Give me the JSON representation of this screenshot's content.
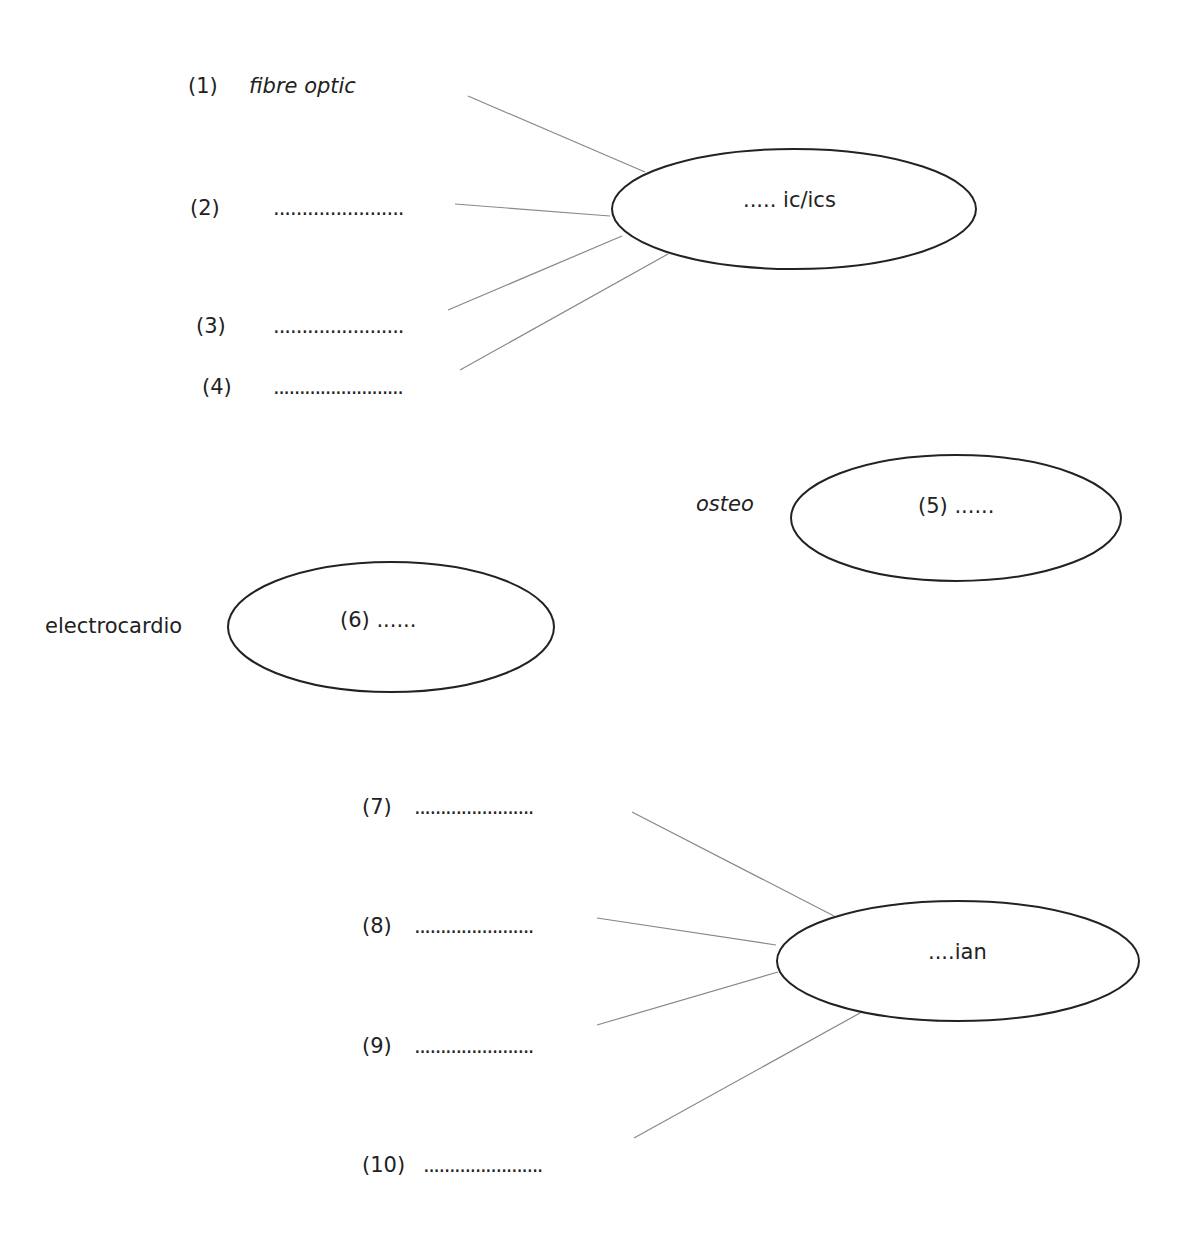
{
  "diagram": {
    "group1": {
      "center": "..... ic/ics",
      "items": [
        {
          "num": "(1)",
          "text": "fibre optic"
        },
        {
          "num": "(2)",
          "text": "......................."
        },
        {
          "num": "(3)",
          "text": "......................."
        },
        {
          "num": "(4)",
          "text": "........................."
        }
      ]
    },
    "group2": {
      "prefix": "osteo",
      "center": "(5) ......"
    },
    "group3": {
      "prefix": "electrocardio",
      "center": "(6) ......"
    },
    "group4": {
      "center": "....ian",
      "items": [
        {
          "num": "(7)",
          "text": "......................."
        },
        {
          "num": "(8)",
          "text": "......................."
        },
        {
          "num": "(9)",
          "text": "......................."
        },
        {
          "num": "(10)",
          "text": "......................."
        }
      ]
    },
    "colors": {
      "line": "#888888",
      "ellipse": "#222222"
    }
  }
}
